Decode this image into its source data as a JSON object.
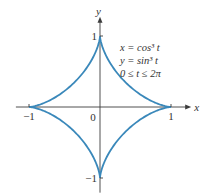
{
  "chart_data": {
    "type": "line",
    "title": "",
    "xlabel": "x",
    "ylabel": "y",
    "xlim": [
      -1.1,
      1.2
    ],
    "ylim": [
      -1.15,
      1.2
    ],
    "grid": false,
    "series": [
      {
        "name": "astroid",
        "parametric": true,
        "x_expr": "cos^3 t",
        "y_expr": "sin^3 t",
        "t_range": [
          0,
          6.283185307
        ],
        "color": "#3a88ba"
      }
    ],
    "x_ticks": [
      {
        "value": -1,
        "label": "−1"
      },
      {
        "value": 1,
        "label": "1"
      }
    ],
    "y_ticks": [
      {
        "value": 1,
        "label": "1"
      },
      {
        "value": -1,
        "label": "−1"
      }
    ],
    "origin_label": "0",
    "annotations": [
      {
        "lines": [
          "x = cos³ t",
          "y = sin³ t",
          "0 ≤ t ≤ 2π"
        ],
        "position": "top-right"
      }
    ]
  }
}
